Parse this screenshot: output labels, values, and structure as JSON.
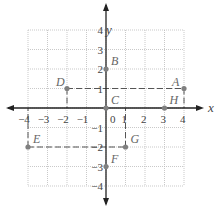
{
  "diagram": {
    "type": "coordinate-plane",
    "axes": {
      "x_label": "x",
      "y_label": "y",
      "x_range": [
        -4,
        4
      ],
      "y_range": [
        -4,
        4
      ],
      "x_ticks": [
        "-4",
        "-3",
        "-2",
        "-1",
        "0",
        "1",
        "2",
        "3",
        "4"
      ],
      "y_ticks": [
        "4",
        "3",
        "2",
        "1",
        "-1",
        "-2",
        "-3",
        "-4"
      ],
      "origin_label": "0"
    },
    "grid": {
      "on": true,
      "style": "dotted",
      "step": 1
    },
    "points": [
      {
        "label": "A",
        "x": 4,
        "y": 1
      },
      {
        "label": "B",
        "x": 0,
        "y": 2
      },
      {
        "label": "C",
        "x": 0,
        "y": 0
      },
      {
        "label": "D",
        "x": -2,
        "y": 1
      },
      {
        "label": "E",
        "x": -4,
        "y": -2
      },
      {
        "label": "F",
        "x": 0,
        "y": -3
      },
      {
        "label": "G",
        "x": 1,
        "y": -2
      },
      {
        "label": "H",
        "x": 3,
        "y": 0
      }
    ],
    "dashed_lines": [
      {
        "from": "D",
        "to": "A"
      },
      {
        "from": "E",
        "to": "G"
      }
    ],
    "colors": {
      "point": "#808080",
      "axis": "#222222",
      "grid": "#bbbbbb",
      "dashed": "#555555",
      "label": "#666666"
    }
  }
}
